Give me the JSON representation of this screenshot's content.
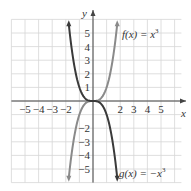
{
  "chart_data": {
    "type": "line",
    "title": "",
    "xlabel": "x",
    "ylabel": "y",
    "xlim": [
      -6,
      6.5
    ],
    "ylim": [
      -6,
      6
    ],
    "grid": true,
    "x_ticks": [
      "-5",
      "-4",
      "-3",
      "-2",
      "2",
      "3",
      "4",
      "5"
    ],
    "y_ticks": [
      "5",
      "4",
      "3",
      "2",
      "1",
      "-2",
      "-3",
      "-4",
      "-5"
    ],
    "series": [
      {
        "name": "f(x) = x^3",
        "label": "f(x) = x",
        "exponent": "3",
        "color": "#8a8a8a",
        "x": [
          -1.78,
          -1.5,
          -1.0,
          -0.5,
          0,
          0.5,
          1.0,
          1.5,
          1.78
        ],
        "values": [
          -5.64,
          -3.375,
          -1,
          -0.125,
          0,
          0.125,
          1,
          3.375,
          5.64
        ]
      },
      {
        "name": "g(x) = -x^3",
        "label": "g(x) = −x",
        "exponent": "3",
        "color": "#3a3a3a",
        "x": [
          -1.78,
          -1.5,
          -1.0,
          -0.5,
          0,
          0.5,
          1.0,
          1.5,
          1.78
        ],
        "values": [
          5.64,
          3.375,
          1,
          0.125,
          0,
          -0.125,
          -1,
          -3.375,
          -5.64
        ]
      }
    ],
    "annotations": [
      {
        "text": "f(x) = x",
        "sup": "3",
        "x": 1.9,
        "y": 5
      },
      {
        "text": "g(x) = −x",
        "sup": "3",
        "x": 1.9,
        "y": -5.5
      }
    ]
  },
  "labels": {
    "x_axis": "x",
    "y_axis": "y",
    "f_label": "f(x) = x",
    "f_sup": "3",
    "g_label": "g(x) = −x",
    "g_sup": "3"
  },
  "colors": {
    "grid": "#d6d6d6",
    "axis": "#444444",
    "f_curve": "#8a8a8a",
    "g_curve": "#3a3a3a"
  }
}
